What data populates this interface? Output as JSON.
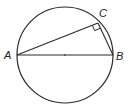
{
  "diagram": {
    "type": "geometry",
    "circle": {
      "cx": 65,
      "cy": 55,
      "r": 48
    },
    "points": {
      "A": {
        "x": 17,
        "y": 55,
        "label": "A"
      },
      "B": {
        "x": 113,
        "y": 55,
        "label": "B"
      },
      "C": {
        "x": 98,
        "y": 23,
        "label": "C"
      }
    },
    "segments": [
      "AB",
      "AC",
      "CB"
    ],
    "right_angle_at": "C",
    "colors": {
      "stroke": "#2a2a2a",
      "background": "#ffffff"
    }
  }
}
